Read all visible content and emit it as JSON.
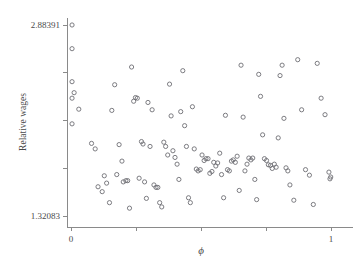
{
  "figure": {
    "name": "relative-wages-scatter",
    "background_color": "#ffffff",
    "axis_color": "#8a8a8a",
    "marker_color": "#6e6e74",
    "cropped_title_fragment": "       "
  },
  "chart_data": {
    "type": "scatter",
    "title": "",
    "xlabel": "ϕ",
    "ylabel": "Relative wages",
    "xlim": [
      0,
      1
    ],
    "ylim": [
      1.32083,
      2.88391
    ],
    "grid": false,
    "legend": null,
    "x_tick_labels": [
      "0",
      "",
      "",
      "",
      "1"
    ],
    "x_tick_values": [
      0,
      0.25,
      0.5,
      0.75,
      1
    ],
    "y_tick_labels": [
      "1.32083",
      "",
      "",
      "",
      "2.88391"
    ],
    "y_tick_values": [
      1.32083,
      1.7116,
      2.10237,
      2.49314,
      2.88391
    ],
    "marker_style": "open-circle",
    "marker_radius_px": 2.1,
    "n_points": 118,
    "x": [
      0.004,
      0.004,
      0.004,
      0.004,
      0.012,
      0.004,
      0.03,
      0.079,
      0.093,
      0.104,
      0.12,
      0.128,
      0.137,
      0.148,
      0.157,
      0.168,
      0.176,
      0.185,
      0.196,
      0.201,
      0.211,
      0.218,
      0.225,
      0.233,
      0.241,
      0.248,
      0.255,
      0.262,
      0.271,
      0.277,
      0.283,
      0.29,
      0.296,
      0.304,
      0.312,
      0.319,
      0.327,
      0.334,
      0.341,
      0.349,
      0.357,
      0.364,
      0.372,
      0.379,
      0.385,
      0.392,
      0.4,
      0.408,
      0.415,
      0.422,
      0.43,
      0.437,
      0.444,
      0.452,
      0.459,
      0.467,
      0.474,
      0.482,
      0.489,
      0.497,
      0.504,
      0.512,
      0.519,
      0.527,
      0.534,
      0.542,
      0.549,
      0.557,
      0.564,
      0.572,
      0.579,
      0.587,
      0.594,
      0.602,
      0.609,
      0.617,
      0.624,
      0.632,
      0.639,
      0.647,
      0.654,
      0.662,
      0.669,
      0.677,
      0.684,
      0.692,
      0.699,
      0.707,
      0.714,
      0.722,
      0.729,
      0.737,
      0.744,
      0.752,
      0.759,
      0.767,
      0.774,
      0.782,
      0.789,
      0.797,
      0.804,
      0.812,
      0.819,
      0.827,
      0.834,
      0.842,
      0.857,
      0.872,
      0.887,
      0.902,
      0.917,
      0.932,
      0.947,
      0.962,
      0.977,
      0.992,
      0.996,
      0.999
    ],
    "y": [
      2.884,
      2.69,
      2.42,
      2.285,
      2.33,
      2.075,
      2.195,
      1.915,
      1.87,
      1.56,
      1.52,
      1.65,
      1.59,
      1.43,
      2.185,
      2.395,
      1.66,
      1.905,
      1.77,
      1.6,
      1.61,
      1.61,
      1.385,
      2.54,
      2.26,
      2.29,
      2.285,
      1.63,
      1.93,
      1.91,
      1.6,
      1.465,
      2.25,
      1.89,
      2.19,
      1.575,
      1.555,
      1.555,
      1.43,
      1.395,
      1.925,
      1.89,
      1.82,
      2.4,
      2.14,
      1.855,
      1.8,
      1.745,
      1.62,
      2.175,
      2.51,
      2.06,
      1.89,
      1.47,
      1.43,
      2.215,
      1.87,
      1.705,
      1.69,
      1.7,
      1.82,
      1.775,
      1.79,
      1.79,
      1.67,
      1.685,
      1.76,
      1.73,
      1.755,
      1.835,
      1.66,
      1.47,
      2.145,
      1.7,
      1.69,
      1.77,
      1.78,
      1.76,
      1.81,
      1.53,
      2.555,
      2.13,
      1.69,
      1.745,
      1.795,
      1.78,
      1.795,
      1.62,
      1.455,
      2.48,
      2.3,
      1.985,
      1.79,
      1.775,
      1.74,
      1.735,
      1.71,
      1.745,
      1.72,
      1.96,
      2.47,
      2.555,
      2.12,
      1.715,
      1.69,
      1.575,
      1.45,
      2.6,
      2.19,
      1.7,
      1.655,
      1.415,
      2.57,
      2.285,
      2.15,
      1.68,
      1.625,
      1.64
    ]
  }
}
